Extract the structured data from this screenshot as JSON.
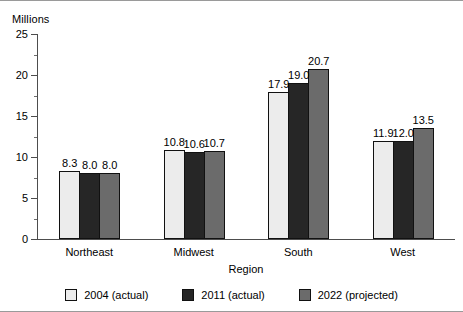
{
  "chart_data": {
    "type": "bar",
    "title": "",
    "xlabel": "Region",
    "ylabel": "Millions",
    "ylim": [
      0,
      25
    ],
    "ytick_step": 5,
    "yminor_step": 2.5,
    "grid": false,
    "legend_position": "bottom",
    "categories": [
      "Northeast",
      "Midwest",
      "South",
      "West"
    ],
    "yticks": [
      "0",
      "5",
      "10",
      "15",
      "20",
      "25"
    ],
    "series": [
      {
        "name": "2004 (actual)",
        "color": "#ececec",
        "values": [
          8.3,
          10.8,
          17.9,
          11.9
        ],
        "labels": [
          "8.3",
          "10.8",
          "17.9",
          "11.9"
        ]
      },
      {
        "name": "2011 (actual)",
        "color": "#262626",
        "values": [
          8.0,
          10.6,
          19.0,
          12.0
        ],
        "labels": [
          "8.0",
          "10.6",
          "19.0",
          "12.0"
        ]
      },
      {
        "name": "2022 (projected)",
        "color": "#6b6b6b",
        "values": [
          8.0,
          10.7,
          20.7,
          13.5
        ],
        "labels": [
          "8.0",
          "10.7",
          "20.7",
          "13.5"
        ]
      }
    ]
  }
}
